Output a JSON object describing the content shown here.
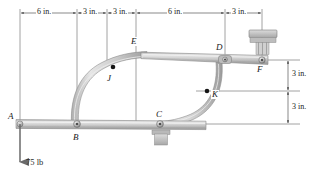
{
  "figure": {
    "type": "statics-frame-diagram",
    "background_color": "#ffffff",
    "member_fill": "#c9c9c9",
    "member_edge": "#8a8a8a",
    "line_color": "#3a3a3a"
  },
  "dimensions": {
    "top": [
      {
        "label": "6 in.",
        "value": 6,
        "unit": "in.",
        "from_x": 20,
        "to_x": 77
      },
      {
        "label": "3 in.",
        "value": 3,
        "unit": "in.",
        "from_x": 77,
        "to_x": 107
      },
      {
        "label": "3 in.",
        "value": 3,
        "unit": "in.",
        "from_x": 107,
        "to_x": 136
      },
      {
        "label": "6 in.",
        "value": 6,
        "unit": "in.",
        "from_x": 136,
        "to_x": 225
      },
      {
        "label": "3 in.",
        "value": 3,
        "unit": "in.",
        "from_x": 225,
        "to_x": 262
      }
    ],
    "right": [
      {
        "label": "3 in.",
        "value": 3,
        "unit": "in.",
        "from_y": 60,
        "to_y": 91
      },
      {
        "label": "3 in.",
        "value": 3,
        "unit": "in.",
        "from_y": 91,
        "to_y": 124
      }
    ]
  },
  "points": [
    {
      "id": "A",
      "label": "A",
      "kind": "pin-joint",
      "x": 20,
      "y": 124,
      "label_x": 8,
      "label_y": 112
    },
    {
      "id": "B",
      "label": "B",
      "kind": "pin-joint",
      "x": 77,
      "y": 124,
      "label_x": 73,
      "label_y": 133
    },
    {
      "id": "C",
      "label": "C",
      "kind": "pin-support",
      "x": 160,
      "y": 124,
      "label_x": 155,
      "label_y": 111
    },
    {
      "id": "D",
      "label": "D",
      "kind": "pin-joint",
      "x": 225,
      "y": 60,
      "label_x": 216,
      "label_y": 44
    },
    {
      "id": "E",
      "label": "E",
      "kind": "reference",
      "x": 136,
      "y": 60,
      "label_x": 130,
      "label_y": 38
    },
    {
      "id": "F",
      "label": "F",
      "kind": "pin-joint",
      "x": 262,
      "y": 60,
      "label_x": 258,
      "label_y": 66
    },
    {
      "id": "J",
      "label": "J",
      "kind": "point-marker",
      "x": 113,
      "y": 67,
      "label_x": 108,
      "label_y": 75
    },
    {
      "id": "K",
      "label": "K",
      "kind": "point-marker",
      "x": 207,
      "y": 91,
      "label_x": 211,
      "label_y": 92
    }
  ],
  "load": {
    "label": "75 lb",
    "magnitude": 75,
    "unit": "lb",
    "direction": "down",
    "applied_at": "A",
    "arrow_x": 20,
    "arrow_top_y": 124,
    "arrow_tip_y": 168,
    "label_x": 25,
    "label_y": 160
  },
  "members": [
    {
      "id": "AD-bar",
      "name": "lower-horizontal-bar",
      "from": "A",
      "to": "beyond-C",
      "type": "straight"
    },
    {
      "id": "ED-bar",
      "name": "upper-horizontal-bar",
      "from": "arc-top",
      "to": "F",
      "type": "straight"
    },
    {
      "id": "BJ-arc",
      "name": "left-curved-member",
      "from": "B",
      "to": "upper-bar",
      "type": "arc"
    },
    {
      "id": "DK-arc",
      "name": "right-curved-member",
      "from": "D",
      "to": "C",
      "type": "arc"
    }
  ],
  "supports": [
    {
      "id": "F-support",
      "kind": "fixed-hatched-block",
      "x": 262,
      "y": 60
    },
    {
      "id": "C-support",
      "kind": "pin-base-block",
      "x": 160,
      "y": 124
    }
  ],
  "caption": {
    "text": ""
  }
}
